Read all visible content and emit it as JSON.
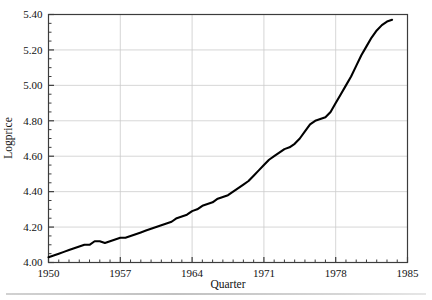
{
  "figure": {
    "title": "",
    "xaxis_title": "Quarter",
    "yaxis_title": "Logprice",
    "xtick_labels": [
      "1950",
      "1957",
      "1964",
      "1971",
      "1978",
      "1985"
    ],
    "ytick_labels": [
      "4.00",
      "4.20",
      "4.40",
      "4.60",
      "4.80",
      "5.00",
      "5.20",
      "5.40"
    ],
    "line_color": "#000000",
    "grid_color": "#cccccc",
    "frame_color": "#3c3c3c",
    "background_color": "#ffffff"
  },
  "chart_data": {
    "type": "line",
    "title": "",
    "xlabel": "Quarter",
    "ylabel": "Logprice",
    "xlim": [
      1950,
      1985
    ],
    "ylim": [
      4.0,
      5.4
    ],
    "xticks": [
      1950,
      1957,
      1964,
      1971,
      1978,
      1985
    ],
    "yticks": [
      4.0,
      4.2,
      4.4,
      4.6,
      4.8,
      5.0,
      5.2,
      5.4
    ],
    "minor_ticks": true,
    "grid": true,
    "legend": null,
    "series": [
      {
        "name": "Logprice",
        "x": [
          1950.0,
          1950.5,
          1951.0,
          1951.5,
          1952.0,
          1952.5,
          1953.0,
          1953.5,
          1954.0,
          1954.5,
          1955.0,
          1955.5,
          1956.0,
          1956.5,
          1957.0,
          1957.5,
          1958.0,
          1958.5,
          1959.0,
          1959.5,
          1960.0,
          1960.5,
          1961.0,
          1961.5,
          1962.0,
          1962.5,
          1963.0,
          1963.5,
          1964.0,
          1964.5,
          1965.0,
          1965.5,
          1966.0,
          1966.5,
          1967.0,
          1967.5,
          1968.0,
          1968.5,
          1969.0,
          1969.5,
          1970.0,
          1970.5,
          1971.0,
          1971.5,
          1972.0,
          1972.5,
          1973.0,
          1973.5,
          1974.0,
          1974.5,
          1975.0,
          1975.5,
          1976.0,
          1976.5,
          1977.0,
          1977.5,
          1978.0,
          1978.5,
          1979.0,
          1979.5,
          1980.0,
          1980.5,
          1981.0,
          1981.5,
          1982.0,
          1982.5,
          1983.0,
          1983.5
        ],
        "y": [
          4.03,
          4.04,
          4.05,
          4.06,
          4.07,
          4.08,
          4.09,
          4.1,
          4.1,
          4.12,
          4.12,
          4.11,
          4.12,
          4.13,
          4.14,
          4.14,
          4.15,
          4.16,
          4.17,
          4.18,
          4.19,
          4.2,
          4.21,
          4.22,
          4.23,
          4.25,
          4.26,
          4.27,
          4.29,
          4.3,
          4.32,
          4.33,
          4.34,
          4.36,
          4.37,
          4.38,
          4.4,
          4.42,
          4.44,
          4.46,
          4.49,
          4.52,
          4.55,
          4.58,
          4.6,
          4.62,
          4.64,
          4.65,
          4.67,
          4.7,
          4.74,
          4.78,
          4.8,
          4.81,
          4.82,
          4.85,
          4.9,
          4.95,
          5.0,
          5.05,
          5.11,
          5.17,
          5.22,
          5.27,
          5.31,
          5.34,
          5.36,
          5.37
        ]
      }
    ]
  }
}
